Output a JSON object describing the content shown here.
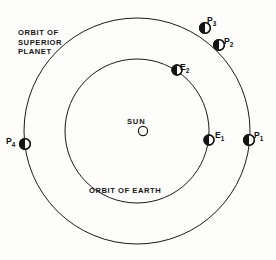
{
  "figure": {
    "background_color": "#fdfdfb",
    "ink_color": "#141414"
  },
  "captions": {
    "superior_orbit": "ORBIT OF\nSUPERIOR\nPLANET",
    "earth_orbit": "ORBIT OF EARTH",
    "sun": "SUN"
  },
  "orbits": [
    {
      "id": "outer-orbit",
      "name": "ORBIT OF SUPERIOR PLANET",
      "center_x": 137,
      "center_y": 131,
      "radius": 113,
      "stroke_width": 1.0
    },
    {
      "id": "inner-orbit",
      "name": "ORBIT OF EARTH",
      "center_x": 137,
      "center_y": 131,
      "radius": 72,
      "stroke_width": 1.0
    }
  ],
  "sun": {
    "label": "SUN",
    "center_x": 143,
    "center_y": 131,
    "radius": 4.6,
    "filled": false
  },
  "bodies": [
    {
      "id": "P1",
      "label": "P",
      "subscript": "1",
      "orbit": "outer-orbit",
      "center_x": 249,
      "center_y": 140,
      "radius": 5.4,
      "shading": "left-half-dark"
    },
    {
      "id": "P2",
      "label": "P",
      "subscript": "2",
      "orbit": "outer-orbit",
      "center_x": 219,
      "center_y": 45,
      "radius": 5.4,
      "shading": "left-half-dark"
    },
    {
      "id": "P3",
      "label": "P",
      "subscript": "3",
      "orbit": "outer-orbit",
      "center_x": 205,
      "center_y": 28,
      "radius": 5.4,
      "shading": "left-half-dark"
    },
    {
      "id": "P4",
      "label": "P",
      "subscript": "4",
      "orbit": "outer-orbit",
      "center_x": 25,
      "center_y": 144,
      "radius": 5.4,
      "shading": "left-half-dark"
    },
    {
      "id": "E1",
      "label": "E",
      "subscript": "1",
      "orbit": "inner-orbit",
      "center_x": 209,
      "center_y": 140,
      "radius": 5.0,
      "shading": "left-half-dark"
    },
    {
      "id": "E2",
      "label": "E",
      "subscript": "2",
      "orbit": "inner-orbit",
      "center_x": 177,
      "center_y": 70,
      "radius": 5.0,
      "shading": "left-half-dark"
    }
  ]
}
